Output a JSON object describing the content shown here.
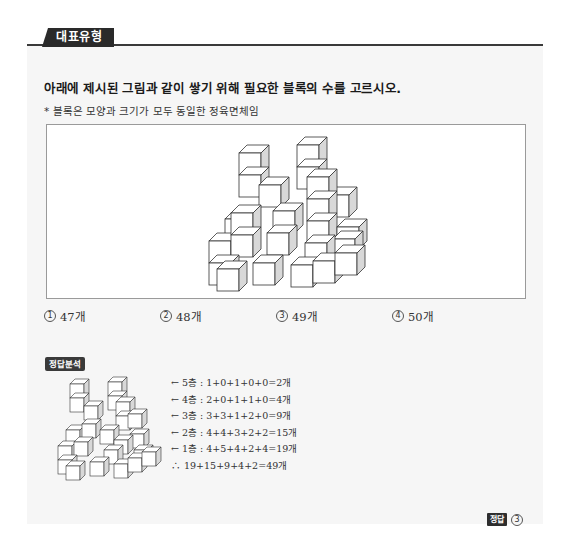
{
  "header": {
    "tag": "대표유형"
  },
  "question": {
    "text": "아래에 제시된 그림과 같이 쌓기 위해 필요한 블록의 수를 고르시오.",
    "note": "* 블록은 모양과 크기가 모두 동일한 정육면체임"
  },
  "figure": {
    "icon": "stacked-cubes-figure"
  },
  "choices": [
    {
      "num": "1",
      "label": "47개"
    },
    {
      "num": "2",
      "label": "48개"
    },
    {
      "num": "3",
      "label": "49개"
    },
    {
      "num": "4",
      "label": "50개"
    }
  ],
  "analysis": {
    "badge": "정답분석",
    "steps": [
      "← 5층 : 1+0+1+0+0=2개",
      "← 4층 : 2+0+1+1+0=4개",
      "← 3층 : 3+3+1+2+0=9개",
      "← 2층 : 4+4+3+2+2=15개",
      "← 1층 : 4+5+4+2+4=19개",
      "∴ 19+15+9+4+2=49개"
    ]
  },
  "answer": {
    "badge": "정답",
    "value": "3"
  }
}
